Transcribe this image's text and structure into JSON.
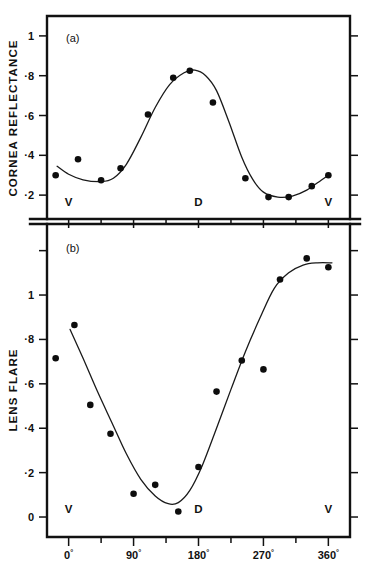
{
  "figure": {
    "background": "#ffffff",
    "ink": "#111111",
    "width": 369,
    "height": 565
  },
  "chart_data": [
    {
      "type": "scatter",
      "panel_label": "(a)",
      "title": "",
      "xlabel": "",
      "ylabel": "CORNEA REFLECTANCE",
      "xlim": [
        -30,
        390
      ],
      "ylim": [
        0.08,
        1.1
      ],
      "grid": false,
      "legend": null,
      "x_ticks_major": [
        0,
        90,
        180,
        270,
        360
      ],
      "x_ticks_minor": [
        45,
        135,
        225,
        315
      ],
      "x_ticklabels": [
        "",
        "",
        "",
        "",
        ""
      ],
      "y_ticks": [
        0.2,
        0.4,
        0.6,
        0.8,
        1.0
      ],
      "y_ticklabels": [
        "·2",
        "·4",
        "·6",
        "·8",
        "1"
      ],
      "annotations": [
        {
          "text": "V",
          "x": 0,
          "y": 0.145
        },
        {
          "text": "D",
          "x": 180,
          "y": 0.145
        },
        {
          "text": "V",
          "x": 360,
          "y": 0.145
        }
      ],
      "points": [
        {
          "x": -18,
          "y": 0.3
        },
        {
          "x": 13,
          "y": 0.38
        },
        {
          "x": 45,
          "y": 0.275
        },
        {
          "x": 72,
          "y": 0.335
        },
        {
          "x": 110,
          "y": 0.605
        },
        {
          "x": 145,
          "y": 0.79
        },
        {
          "x": 168,
          "y": 0.825
        },
        {
          "x": 200,
          "y": 0.665
        },
        {
          "x": 245,
          "y": 0.285
        },
        {
          "x": 277,
          "y": 0.19
        },
        {
          "x": 305,
          "y": 0.19
        },
        {
          "x": 337,
          "y": 0.245
        },
        {
          "x": 360,
          "y": 0.3
        }
      ],
      "fit_curve": [
        {
          "x": -16,
          "y": 0.345
        },
        {
          "x": 0,
          "y": 0.305
        },
        {
          "x": 20,
          "y": 0.277
        },
        {
          "x": 45,
          "y": 0.268
        },
        {
          "x": 62,
          "y": 0.285
        },
        {
          "x": 80,
          "y": 0.355
        },
        {
          "x": 100,
          "y": 0.49
        },
        {
          "x": 120,
          "y": 0.64
        },
        {
          "x": 140,
          "y": 0.755
        },
        {
          "x": 160,
          "y": 0.815
        },
        {
          "x": 175,
          "y": 0.828
        },
        {
          "x": 190,
          "y": 0.8
        },
        {
          "x": 205,
          "y": 0.725
        },
        {
          "x": 222,
          "y": 0.57
        },
        {
          "x": 240,
          "y": 0.39
        },
        {
          "x": 255,
          "y": 0.28
        },
        {
          "x": 270,
          "y": 0.215
        },
        {
          "x": 290,
          "y": 0.19
        },
        {
          "x": 310,
          "y": 0.195
        },
        {
          "x": 330,
          "y": 0.225
        },
        {
          "x": 350,
          "y": 0.275
        },
        {
          "x": 362,
          "y": 0.305
        }
      ]
    },
    {
      "type": "scatter",
      "panel_label": "(b)",
      "title": "",
      "xlabel": "",
      "ylabel": "LENS FLARE",
      "xlim": [
        -30,
        390
      ],
      "ylim": [
        -0.09,
        1.32
      ],
      "grid": false,
      "legend": null,
      "x_ticks_major": [
        0,
        90,
        180,
        270,
        360
      ],
      "x_ticks_minor": [
        45,
        135,
        225,
        315
      ],
      "x_ticklabels": [
        "0°",
        "90°",
        "180°",
        "270°",
        "360°"
      ],
      "y_ticks": [
        0.0,
        0.2,
        0.4,
        0.6,
        0.8,
        1.0,
        1.2
      ],
      "y_ticklabels": [
        "0",
        "·2",
        "·4",
        "·6",
        "·8",
        "1",
        ""
      ],
      "annotations": [
        {
          "text": "V",
          "x": 0,
          "y": 0.02
        },
        {
          "text": "D",
          "x": 180,
          "y": 0.02
        },
        {
          "text": "V",
          "x": 360,
          "y": 0.02
        }
      ],
      "points": [
        {
          "x": -18,
          "y": 0.715
        },
        {
          "x": 8,
          "y": 0.865
        },
        {
          "x": 30,
          "y": 0.505
        },
        {
          "x": 58,
          "y": 0.375
        },
        {
          "x": 90,
          "y": 0.105
        },
        {
          "x": 120,
          "y": 0.145
        },
        {
          "x": 152,
          "y": 0.025
        },
        {
          "x": 180,
          "y": 0.225
        },
        {
          "x": 205,
          "y": 0.565
        },
        {
          "x": 240,
          "y": 0.705
        },
        {
          "x": 270,
          "y": 0.665
        },
        {
          "x": 293,
          "y": 1.07
        },
        {
          "x": 330,
          "y": 1.165
        },
        {
          "x": 360,
          "y": 1.125
        }
      ],
      "fit_curve": [
        {
          "x": 2,
          "y": 0.845
        },
        {
          "x": 20,
          "y": 0.715
        },
        {
          "x": 40,
          "y": 0.565
        },
        {
          "x": 60,
          "y": 0.425
        },
        {
          "x": 80,
          "y": 0.285
        },
        {
          "x": 100,
          "y": 0.17
        },
        {
          "x": 120,
          "y": 0.095
        },
        {
          "x": 138,
          "y": 0.06
        },
        {
          "x": 152,
          "y": 0.065
        },
        {
          "x": 168,
          "y": 0.12
        },
        {
          "x": 185,
          "y": 0.23
        },
        {
          "x": 205,
          "y": 0.4
        },
        {
          "x": 225,
          "y": 0.575
        },
        {
          "x": 245,
          "y": 0.745
        },
        {
          "x": 265,
          "y": 0.895
        },
        {
          "x": 285,
          "y": 1.03
        },
        {
          "x": 305,
          "y": 1.1
        },
        {
          "x": 325,
          "y": 1.135
        },
        {
          "x": 345,
          "y": 1.145
        },
        {
          "x": 365,
          "y": 1.145
        }
      ]
    }
  ]
}
